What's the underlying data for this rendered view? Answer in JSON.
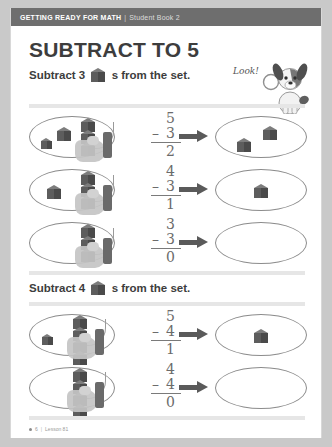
{
  "header": {
    "title": "GETTING READY FOR MATH",
    "separator": "|",
    "subtitle": "Student Book 2"
  },
  "page": {
    "title": "SUBTRACT TO 5",
    "mascot_label": "Look!",
    "mascot_icon": "dog-with-magnifier-icon"
  },
  "sections": [
    {
      "instruction_prefix": "Subtract",
      "instruction_number": "3",
      "instruction_suffix": "s from the set.",
      "problems": [
        {
          "minuend": "5",
          "operator": "–",
          "subtrahend": "3",
          "answer": "2",
          "start_cubes": 5,
          "cubes_in_left_oval": 2,
          "cubes_removed": 3,
          "cubes_in_right_oval": 2
        },
        {
          "minuend": "4",
          "operator": "–",
          "subtrahend": "3",
          "answer": "1",
          "start_cubes": 4,
          "cubes_in_left_oval": 1,
          "cubes_removed": 3,
          "cubes_in_right_oval": 1
        },
        {
          "minuend": "3",
          "operator": "–",
          "subtrahend": "3",
          "answer": "0",
          "start_cubes": 3,
          "cubes_in_left_oval": 0,
          "cubes_removed": 3,
          "cubes_in_right_oval": 0
        }
      ]
    },
    {
      "instruction_prefix": "Subtract",
      "instruction_number": "4",
      "instruction_suffix": "s from the set.",
      "problems": [
        {
          "minuend": "5",
          "operator": "–",
          "subtrahend": "4",
          "answer": "1",
          "start_cubes": 5,
          "cubes_in_left_oval": 1,
          "cubes_removed": 4,
          "cubes_in_right_oval": 1
        },
        {
          "minuend": "4",
          "operator": "–",
          "subtrahend": "4",
          "answer": "0",
          "start_cubes": 4,
          "cubes_in_left_oval": 0,
          "cubes_removed": 4,
          "cubes_in_right_oval": 0
        }
      ]
    }
  ],
  "footer": {
    "page_number": "6",
    "separator": "|",
    "lesson": "Lesson 81"
  },
  "colors": {
    "header_bar": "#6e6e6e",
    "title_text": "#3d3d3d",
    "divider": "#e6e6e6",
    "cube_dark": "#4a4a4a",
    "oval_stroke": "#8c8c8c",
    "equation_text": "#6b6b6b"
  }
}
